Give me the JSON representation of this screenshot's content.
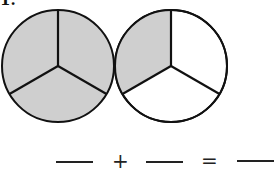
{
  "problem": {
    "number_label": "1.",
    "shade_color": "#cfcfcf",
    "stroke_color": "#111111",
    "circles": [
      {
        "name": "circle-1",
        "parts": 3,
        "shaded": 3
      },
      {
        "name": "circle-2",
        "parts": 3,
        "shaded": 1
      }
    ],
    "equation": {
      "plus": "+",
      "equals": "=",
      "blanks": 3
    }
  }
}
